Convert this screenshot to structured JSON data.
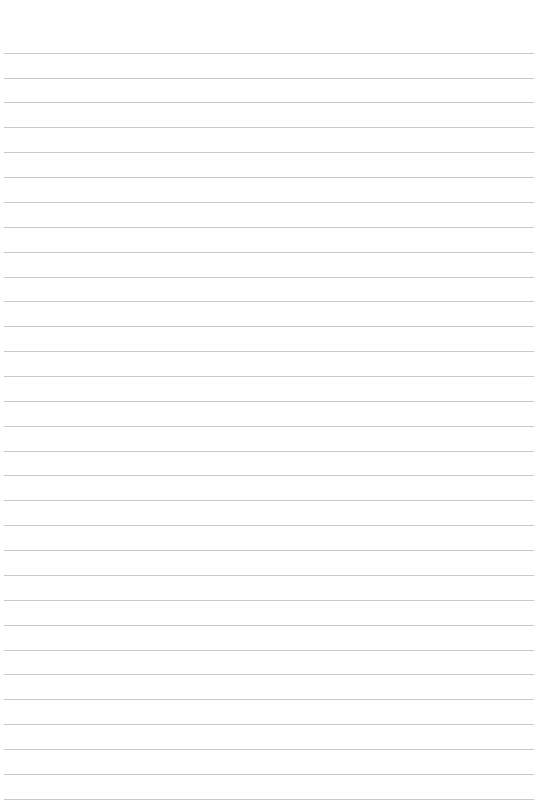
{
  "page": {
    "type": "lined-paper",
    "background_color": "#ffffff",
    "rule_color": "#c9c9c9",
    "rule_count": 31,
    "first_rule_y": 52.7,
    "rule_spacing": 24.87,
    "rule_left": 4,
    "rule_width": 530,
    "text_lines": []
  }
}
